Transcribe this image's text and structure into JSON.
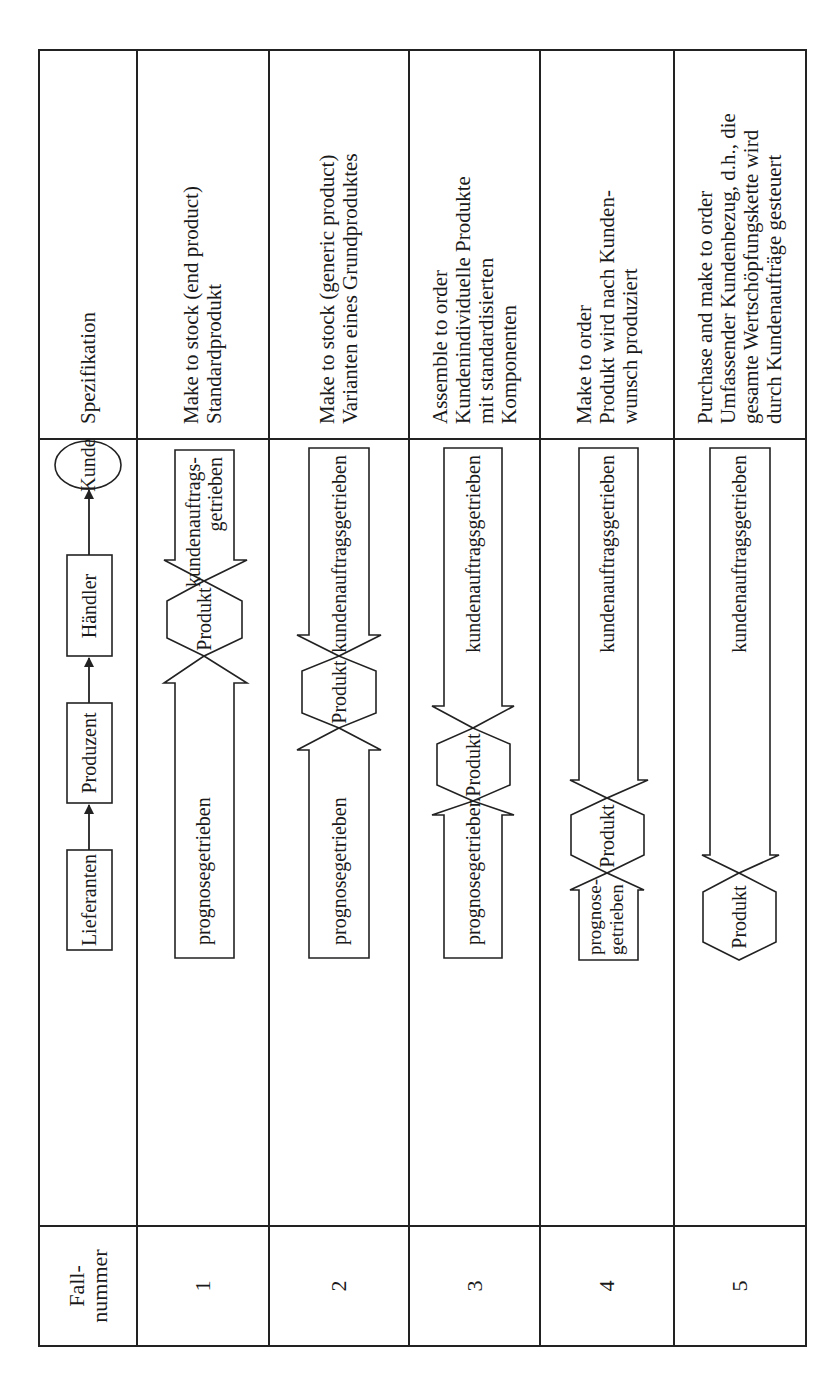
{
  "table": {
    "orientation": "rotated 90 degrees counterclockwise",
    "header": {
      "case_number": [
        "Fall-",
        "nummer"
      ],
      "chain": {
        "supplier": "Lieferanten",
        "producer": "Produzent",
        "dealer": "Händler",
        "customer": "Kunde"
      },
      "specification": "Spezifikation"
    },
    "rows": [
      {
        "number": "1",
        "forecast_label": [
          "prognosegetrieben"
        ],
        "order_label": [
          "kundenauftrags-",
          "getrieben"
        ],
        "product_label": "Produkt",
        "spec": [
          "Make to stock (end product)",
          "Standardprodukt"
        ]
      },
      {
        "number": "2",
        "forecast_label": [
          "prognosegetrieben"
        ],
        "order_label": [
          "kundenauftragsgetrieben"
        ],
        "product_label": "Produkt",
        "spec": [
          "Make to stock (generic product)",
          "Varianten eines Grundproduktes"
        ]
      },
      {
        "number": "3",
        "forecast_label": [
          "prognosegetrieben"
        ],
        "order_label": [
          "kundenauftragsgetrieben"
        ],
        "product_label": "Produkt",
        "spec": [
          "Assemble to order",
          "Kundenindividuelle Produkte",
          "mit standardisierten",
          "Komponenten"
        ]
      },
      {
        "number": "4",
        "forecast_label": [
          "prognose-",
          "getrieben"
        ],
        "order_label": [
          "kundenauftragsgetrieben"
        ],
        "product_label": "Produkt",
        "spec": [
          "Make to order",
          "Produkt wird nach Kunden-",
          "wunsch produziert"
        ]
      },
      {
        "number": "5",
        "forecast_label": [],
        "order_label": [
          "kundenauftragsgetrieben"
        ],
        "product_label": "Produkt",
        "spec": [
          "Purchase and make to order",
          "Umfassender Kundenbezug, d.h., die",
          "gesamte Wertschöpfungskette wird",
          "durch Kundenaufträge gesteuert"
        ]
      }
    ]
  }
}
